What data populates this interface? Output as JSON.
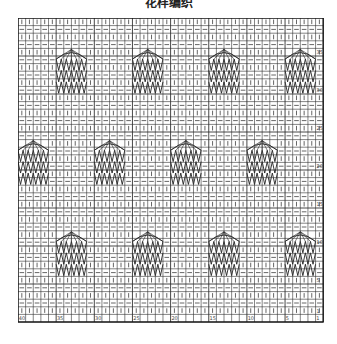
{
  "title": "花样编织",
  "chart": {
    "columns": 40,
    "rows": 40,
    "cell_w": 7.63,
    "cell_h": 7.6,
    "grid_color": "#333333",
    "symbol_color": "#555555",
    "motif_color": "#222222",
    "row_pattern": [
      "knit",
      "purl"
    ],
    "legend": {
      "knit": "|",
      "purl": "—"
    },
    "row_labels": [
      "1",
      "5",
      "10",
      "15",
      "20",
      "25",
      "30",
      "35",
      "40"
    ],
    "col_labels": [
      "40",
      "35",
      "30",
      "25",
      "20",
      "15",
      "10",
      "5",
      "1"
    ],
    "motifs": [
      {
        "row_start": 4,
        "col_start": 5,
        "width": 4,
        "height": 6
      },
      {
        "row_start": 4,
        "col_start": 15,
        "width": 4,
        "height": 6
      },
      {
        "row_start": 4,
        "col_start": 25,
        "width": 4,
        "height": 6
      },
      {
        "row_start": 4,
        "col_start": 35,
        "width": 4,
        "height": 6
      },
      {
        "row_start": 16,
        "col_start": 0,
        "width": 4,
        "height": 6
      },
      {
        "row_start": 16,
        "col_start": 10,
        "width": 4,
        "height": 6
      },
      {
        "row_start": 16,
        "col_start": 20,
        "width": 4,
        "height": 6
      },
      {
        "row_start": 16,
        "col_start": 30,
        "width": 4,
        "height": 6
      },
      {
        "row_start": 28,
        "col_start": 5,
        "width": 4,
        "height": 6
      },
      {
        "row_start": 28,
        "col_start": 15,
        "width": 4,
        "height": 6
      },
      {
        "row_start": 28,
        "col_start": 25,
        "width": 4,
        "height": 6
      },
      {
        "row_start": 28,
        "col_start": 35,
        "width": 4,
        "height": 6
      }
    ]
  }
}
